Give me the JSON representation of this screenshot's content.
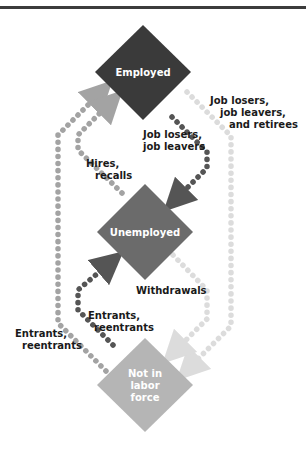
{
  "diagram": {
    "type": "labor-force-flows",
    "colors": {
      "rule": "#3c3c3c",
      "employed": "#3a3a3a",
      "unemployed": "#6b6b6b",
      "not_in_labor_force": "#b5b5b5",
      "dots_dark": "#555555",
      "dots_medium": "#a3a3a3",
      "dots_light": "#dcdcdc",
      "label_text": "#1a1a1a"
    },
    "nodes": [
      {
        "id": "employed",
        "label_lines": [
          "Employed"
        ]
      },
      {
        "id": "unemployed",
        "label_lines": [
          "Unemployed"
        ]
      },
      {
        "id": "not_in_labor_force",
        "label_lines": [
          "Not in",
          "labor",
          "force"
        ]
      }
    ],
    "flows": [
      {
        "id": "hires-recalls",
        "from": "unemployed",
        "to": "employed",
        "label_lines": [
          "Hires,",
          "recalls"
        ]
      },
      {
        "id": "job-losers-leavers",
        "from": "employed",
        "to": "unemployed",
        "label_lines": [
          "Job losers,",
          "job leavers"
        ]
      },
      {
        "id": "job-losers-leavers-retirees",
        "from": "employed",
        "to": "not_in_labor_force",
        "label_lines": [
          "Job losers,",
          "job leavers,",
          "and retirees"
        ]
      },
      {
        "id": "withdrawals",
        "from": "unemployed",
        "to": "not_in_labor_force",
        "label_lines": [
          "Withdrawals"
        ]
      },
      {
        "id": "entrants-reentrants-unemployed",
        "from": "not_in_labor_force",
        "to": "unemployed",
        "label_lines": [
          "Entrants,",
          "reentrants"
        ]
      },
      {
        "id": "entrants-reentrants-employed",
        "from": "not_in_labor_force",
        "to": "employed",
        "label_lines": [
          "Entrants,",
          "reentrants"
        ]
      }
    ]
  }
}
